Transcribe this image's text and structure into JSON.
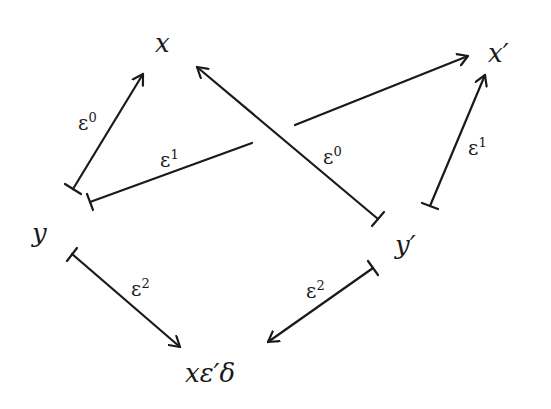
{
  "nodes": {
    "x": {
      "label": "x"
    },
    "x_prime": {
      "label": "x′"
    },
    "y": {
      "label": "y"
    },
    "y_prime": {
      "label": "y′"
    },
    "composite": {
      "label": "xε′δ"
    }
  },
  "edges": {
    "y_to_x": {
      "from": "y",
      "to": "x",
      "base": "ε",
      "sup": "0"
    },
    "y_to_x_prime": {
      "from": "y",
      "to": "x′",
      "base": "ε",
      "sup": "1"
    },
    "y_prime_to_x": {
      "from": "y′",
      "to": "x",
      "base": "ε",
      "sup": "0"
    },
    "y_prime_to_x_prime": {
      "from": "y′",
      "to": "x′",
      "base": "ε",
      "sup": "1"
    },
    "y_to_composite": {
      "from": "y",
      "to": "xε′δ",
      "base": "ε",
      "sup": "2"
    },
    "y_prime_to_composite": {
      "from": "y′",
      "to": "xε′δ",
      "base": "ε",
      "sup": "2"
    }
  },
  "style": {
    "ink": "#1a1a1a",
    "background": "#ffffff"
  }
}
